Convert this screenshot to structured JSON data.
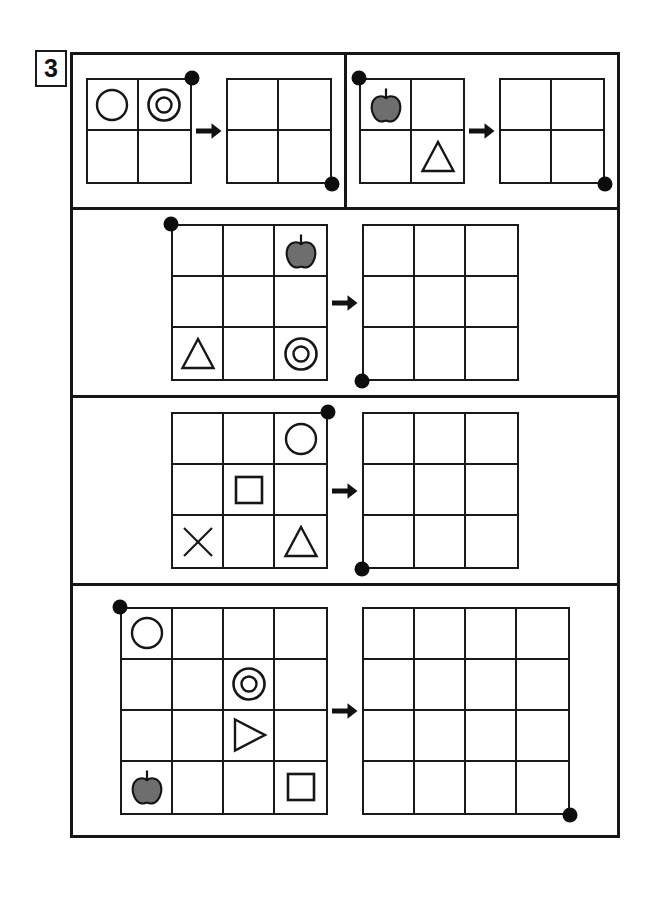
{
  "exercise": {
    "number": "3"
  },
  "legend": {
    "arrow_icon": "arrow-right-icon",
    "marker_icon": "corner-marker-dot",
    "colors": {
      "ink": "#161616",
      "apple_fill": "#6e6e6e",
      "apple_stroke": "#141414",
      "paper": "#ffffff"
    }
  },
  "shape_names": {
    "circle": "circle-shape",
    "double_circle": "concentric-circles-shape",
    "triangle": "triangle-shape",
    "triangle_right": "right-triangle-shape",
    "square": "square-shape",
    "cross": "x-cross-shape",
    "apple": "apple-shape"
  },
  "panels": [
    {
      "id": "panel-1",
      "size": 2,
      "cell": 51,
      "source_marker": "tr",
      "target_marker": "br",
      "source_cells": [
        [
          "circle",
          "double_circle"
        ],
        [
          "",
          ""
        ]
      ],
      "target_cells": [
        [
          "",
          ""
        ],
        [
          "",
          ""
        ]
      ]
    },
    {
      "id": "panel-2",
      "size": 2,
      "cell": 51,
      "source_marker": "tl",
      "target_marker": "br",
      "source_cells": [
        [
          "apple",
          ""
        ],
        [
          "",
          "triangle"
        ]
      ],
      "target_cells": [
        [
          "",
          ""
        ],
        [
          "",
          ""
        ]
      ]
    },
    {
      "id": "panel-3",
      "size": 3,
      "cell": 51,
      "source_marker": "tl",
      "target_marker": "bl",
      "source_cells": [
        [
          "",
          "",
          "apple"
        ],
        [
          "",
          "",
          ""
        ],
        [
          "triangle",
          "",
          "double_circle"
        ]
      ],
      "target_cells": [
        [
          "",
          "",
          ""
        ],
        [
          "",
          "",
          ""
        ],
        [
          "",
          "",
          ""
        ]
      ]
    },
    {
      "id": "panel-4",
      "size": 3,
      "cell": 51,
      "source_marker": "tr",
      "target_marker": "bl",
      "source_cells": [
        [
          "",
          "",
          "circle"
        ],
        [
          "",
          "square",
          ""
        ],
        [
          "cross",
          "",
          "triangle"
        ]
      ],
      "target_cells": [
        [
          "",
          "",
          ""
        ],
        [
          "",
          "",
          ""
        ],
        [
          "",
          "",
          ""
        ]
      ]
    },
    {
      "id": "panel-5",
      "size": 4,
      "cell": 51,
      "source_marker": "tl",
      "target_marker": "br",
      "source_cells": [
        [
          "circle",
          "",
          "",
          ""
        ],
        [
          "",
          "",
          "double_circle",
          ""
        ],
        [
          "",
          "",
          "triangle_right",
          ""
        ],
        [
          "apple",
          "",
          "",
          "square"
        ]
      ],
      "target_cells": [
        [
          "",
          "",
          "",
          ""
        ],
        [
          "",
          "",
          "",
          ""
        ],
        [
          "",
          "",
          "",
          ""
        ],
        [
          "",
          "",
          "",
          ""
        ]
      ]
    }
  ],
  "layout": {
    "frame": {
      "left": 70,
      "top": 52,
      "width": 550,
      "height": 786
    },
    "rows": [
      {
        "top": 0,
        "height": 155,
        "split": true
      },
      {
        "top": 155,
        "height": 188,
        "split": false
      },
      {
        "top": 343,
        "height": 188,
        "split": false
      },
      {
        "top": 531,
        "height": 249,
        "split": false
      }
    ]
  }
}
